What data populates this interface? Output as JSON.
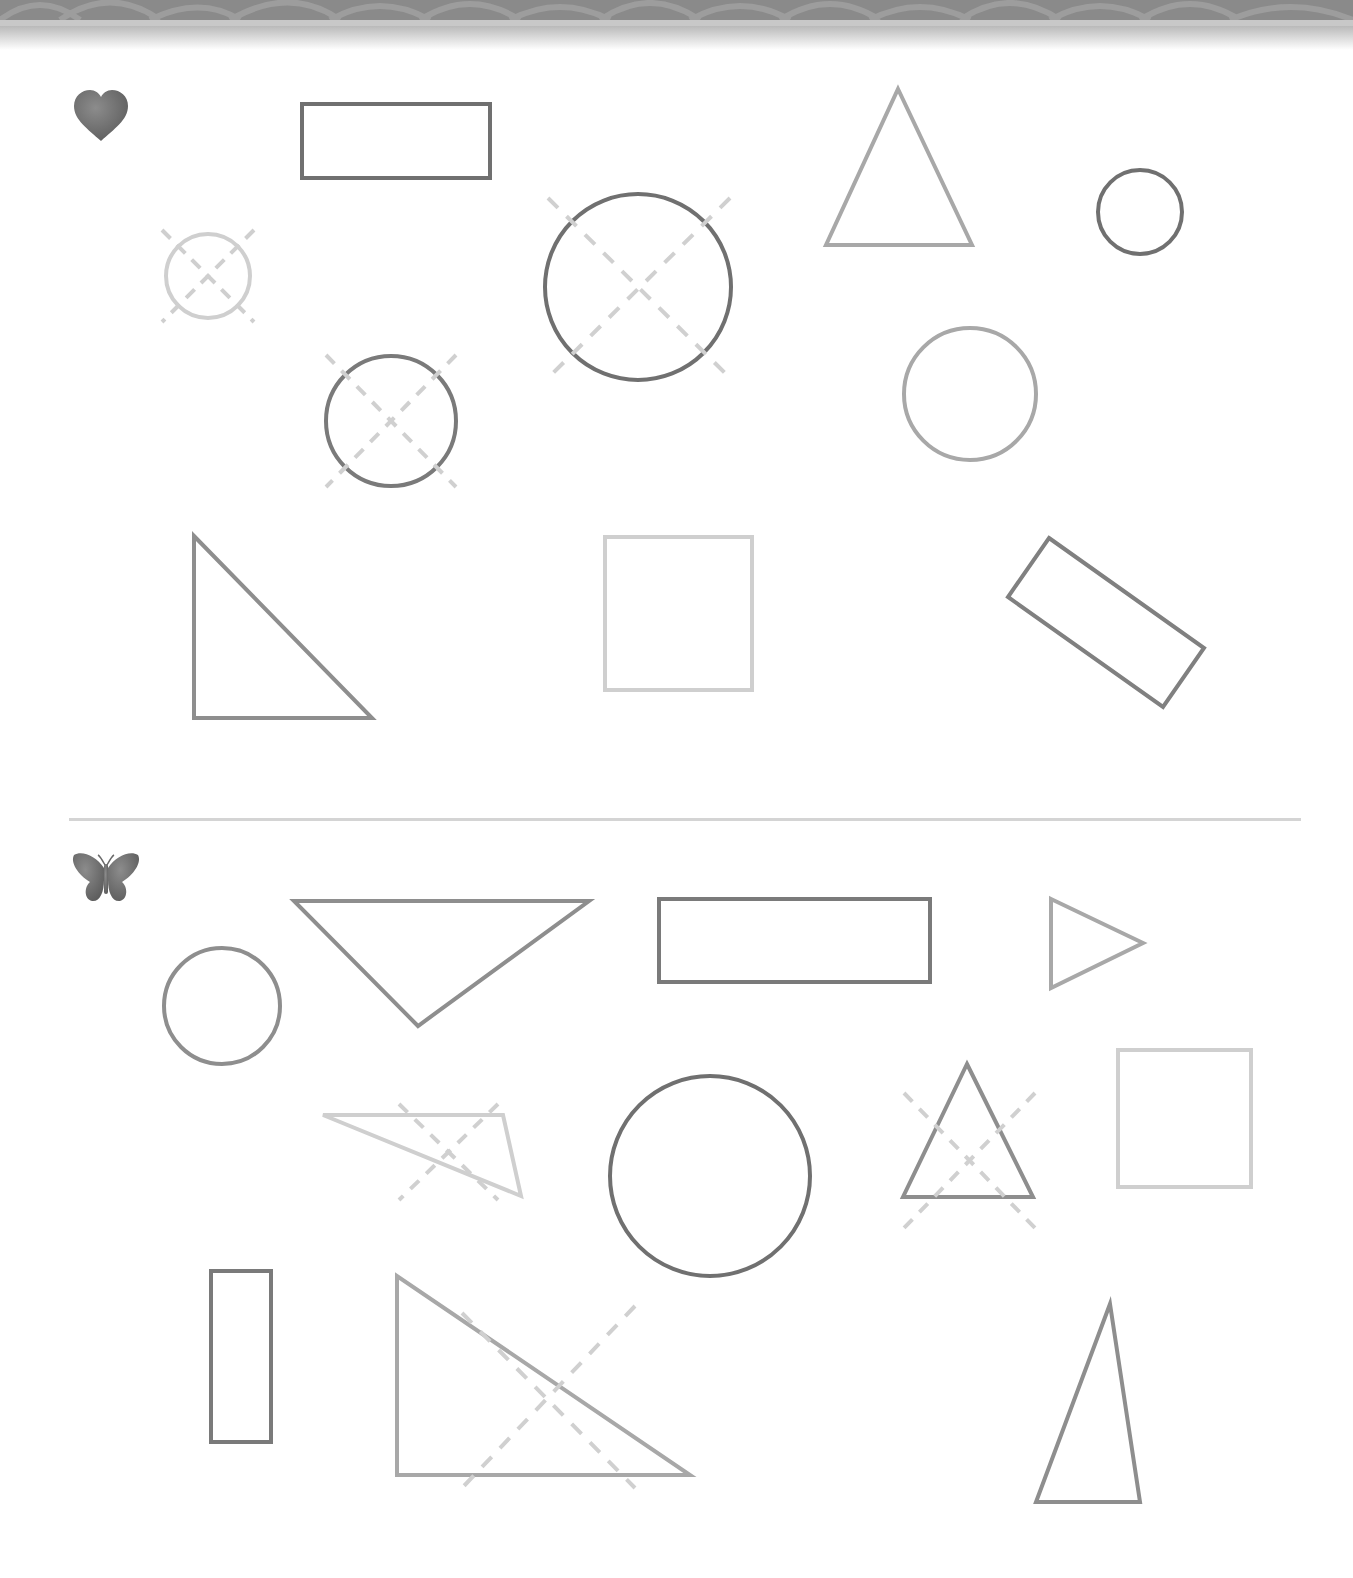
{
  "page": {
    "type": "shapes-worksheet",
    "colors": {
      "dark": "#707070",
      "medium": "#8e8e8e",
      "light": "#a8a8a8",
      "pale": "#cfcfcf",
      "cross_mark": "#d0d0d0",
      "banner": "#8a8a8a",
      "divider": "#d4d4d4"
    }
  },
  "sections": [
    {
      "marker_icon": "heart-icon",
      "shapes": [
        {
          "kind": "rectangle",
          "crossed": false,
          "tone": "dark"
        },
        {
          "kind": "triangle",
          "crossed": false,
          "tone": "light"
        },
        {
          "kind": "circle",
          "crossed": false,
          "tone": "dark"
        },
        {
          "kind": "circle",
          "crossed": true,
          "tone": "pale"
        },
        {
          "kind": "circle",
          "crossed": true,
          "tone": "dark"
        },
        {
          "kind": "circle",
          "crossed": true,
          "tone": "dark"
        },
        {
          "kind": "circle",
          "crossed": false,
          "tone": "light"
        },
        {
          "kind": "right-triangle",
          "crossed": false,
          "tone": "medium"
        },
        {
          "kind": "square",
          "crossed": false,
          "tone": "pale"
        },
        {
          "kind": "rectangle",
          "crossed": false,
          "tone": "medium"
        }
      ]
    },
    {
      "marker_icon": "butterfly-icon",
      "shapes": [
        {
          "kind": "circle",
          "crossed": false,
          "tone": "medium"
        },
        {
          "kind": "triangle",
          "crossed": false,
          "tone": "medium"
        },
        {
          "kind": "rectangle",
          "crossed": false,
          "tone": "dark"
        },
        {
          "kind": "triangle",
          "crossed": false,
          "tone": "light"
        },
        {
          "kind": "triangle",
          "crossed": true,
          "tone": "pale"
        },
        {
          "kind": "circle",
          "crossed": false,
          "tone": "dark"
        },
        {
          "kind": "triangle",
          "crossed": true,
          "tone": "medium"
        },
        {
          "kind": "square",
          "crossed": false,
          "tone": "pale"
        },
        {
          "kind": "rectangle",
          "crossed": false,
          "tone": "dark"
        },
        {
          "kind": "right-triangle",
          "crossed": true,
          "tone": "light"
        },
        {
          "kind": "triangle",
          "crossed": false,
          "tone": "medium"
        }
      ]
    }
  ]
}
